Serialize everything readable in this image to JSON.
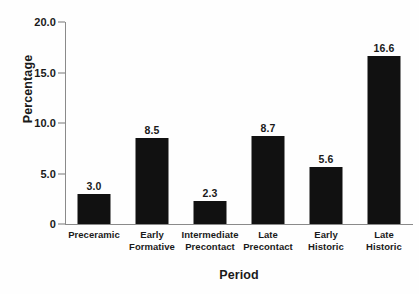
{
  "chart_data": {
    "type": "bar",
    "title": "",
    "xlabel": "Period",
    "ylabel": "Percentage",
    "categories": [
      "Preceramic",
      "Early Formative",
      "Intermediate Precontact",
      "Late Precontact",
      "Early Historic",
      "Late Historic"
    ],
    "category_lines": [
      [
        "Preceramic"
      ],
      [
        "Early",
        "Formative"
      ],
      [
        "Intermediate",
        "Precontact"
      ],
      [
        "Late",
        "Precontact"
      ],
      [
        "Early",
        "Historic"
      ],
      [
        "Late",
        "Historic"
      ]
    ],
    "values": [
      3.0,
      8.5,
      2.3,
      8.7,
      5.6,
      16.6
    ],
    "value_labels": [
      "3.0",
      "8.5",
      "2.3",
      "8.7",
      "5.6",
      "16.6"
    ],
    "ylim": [
      0,
      20.0
    ],
    "yticks": [
      0,
      5.0,
      10.0,
      15.0,
      20.0
    ],
    "ytick_labels": [
      "0",
      "5.0",
      "10.0",
      "15.0",
      "20.0"
    ],
    "grid": false,
    "legend": null,
    "bar_color": "#111111",
    "axis_color": "#8a8a8a",
    "background_color": "#fefefe"
  }
}
